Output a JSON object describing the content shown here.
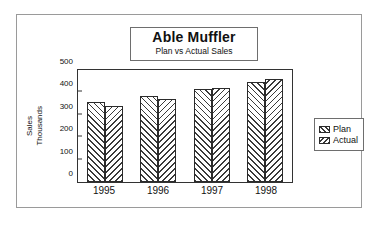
{
  "chart_data": {
    "type": "bar",
    "title": "Able Muffler",
    "subtitle": "Plan vs Actual Sales",
    "xlabel": "",
    "ylabel_lines": [
      "Sales",
      "Thousands"
    ],
    "categories": [
      "1995",
      "1996",
      "1997",
      "1998"
    ],
    "series": [
      {
        "name": "Plan",
        "values": [
          355,
          382,
          417,
          445
        ]
      },
      {
        "name": "Actual",
        "values": [
          340,
          372,
          420,
          458
        ]
      }
    ],
    "ylim": [
      0,
      500
    ],
    "yticks": [
      0,
      100,
      200,
      300,
      400,
      500
    ],
    "ytick_labels": [
      "0",
      "100",
      "200",
      "300",
      "400",
      "500"
    ],
    "grid": false,
    "legend_position": "right",
    "colors": {
      "hatch": "#3a3a3a",
      "fill": "#ffffff",
      "axis": "#333333",
      "frame": "#9a9a9a",
      "text": "#111111"
    }
  }
}
